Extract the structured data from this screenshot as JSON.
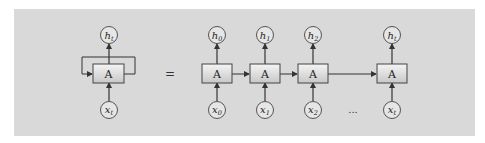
{
  "diagram": {
    "colors": {
      "background": "#d9d9d9",
      "stroke": "#333333",
      "node_fill": "#e6e6e6",
      "box_top": "#f4f4f4",
      "box_bottom": "#c8c8c8"
    },
    "folded": {
      "cell_label": "A",
      "output": {
        "base": "h",
        "sub": "t"
      },
      "input": {
        "base": "x",
        "sub": "t"
      },
      "has_self_loop": true
    },
    "equals_label": "=",
    "ellipsis_label": "...",
    "unrolled": [
      {
        "cell_label": "A",
        "output": {
          "base": "h",
          "sub": "0"
        },
        "input": {
          "base": "x",
          "sub": "0"
        }
      },
      {
        "cell_label": "A",
        "output": {
          "base": "h",
          "sub": "1"
        },
        "input": {
          "base": "x",
          "sub": "1"
        }
      },
      {
        "cell_label": "A",
        "output": {
          "base": "h",
          "sub": "2"
        },
        "input": {
          "base": "x",
          "sub": "2"
        }
      },
      {
        "cell_label": "A",
        "output": {
          "base": "h",
          "sub": "t"
        },
        "input": {
          "base": "x",
          "sub": "t"
        }
      }
    ]
  }
}
